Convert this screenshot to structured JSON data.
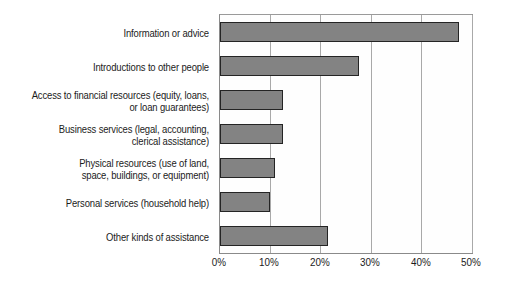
{
  "chart": {
    "title": "",
    "background_color": "#ffffff",
    "bar_fill_color": "#838383",
    "bar_border_color": "#242424",
    "gridline_color": "#a9a9a9",
    "axis_color": "#8a8a8a"
  },
  "chart_data": {
    "type": "bar",
    "orientation": "horizontal",
    "title": "",
    "subtitle": "",
    "xlabel": "",
    "ylabel": "",
    "xlim": [
      0,
      50
    ],
    "grid": true,
    "legend": false,
    "legend_position": "none",
    "xtick_labels": [
      "0%",
      "10%",
      "20%",
      "30%",
      "40%",
      "50%"
    ],
    "xtick_values": [
      0,
      10,
      20,
      30,
      40,
      50
    ],
    "categories": [
      "Information or advice",
      "Introductions to other people",
      "Access to financial resources (equity, loans,\nor loan guarantees)",
      "Business services (legal, accounting,\nclerical assistance)",
      "Physical resources (use of land,\nspace, buildings, or equipment)",
      "Personal services (household help)",
      "Other kinds of assistance"
    ],
    "values": [
      47.5,
      27.5,
      12.5,
      12.5,
      11.0,
      10.0,
      21.5
    ],
    "value_unit": "%"
  }
}
